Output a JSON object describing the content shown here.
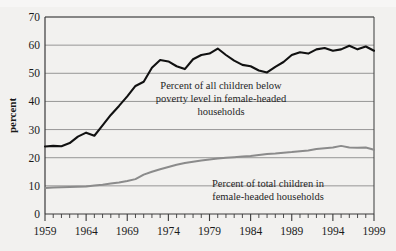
{
  "chart_data": {
    "type": "line",
    "title": "",
    "xlabel": "",
    "ylabel": "percent",
    "xlim": [
      1959,
      1999
    ],
    "ylim": [
      0,
      70
    ],
    "grid": true,
    "legend_position": "inline-annotations",
    "ytick_labels": [
      "0",
      "10",
      "20",
      "30",
      "40",
      "50",
      "60",
      "70"
    ],
    "ytick_values": [
      0,
      10,
      20,
      30,
      40,
      50,
      60,
      70
    ],
    "xtick_labels": [
      "1959",
      "1964",
      "1969",
      "1974",
      "1979",
      "1984",
      "1989",
      "1994",
      "1999"
    ],
    "xtick_values": [
      1959,
      1964,
      1969,
      1974,
      1979,
      1984,
      1989,
      1994,
      1999
    ],
    "x": [
      1959,
      1960,
      1961,
      1962,
      1963,
      1964,
      1965,
      1966,
      1967,
      1968,
      1969,
      1970,
      1971,
      1972,
      1973,
      1974,
      1975,
      1976,
      1977,
      1978,
      1979,
      1980,
      1981,
      1982,
      1983,
      1984,
      1985,
      1986,
      1987,
      1988,
      1989,
      1990,
      1991,
      1992,
      1993,
      1994,
      1995,
      1996,
      1997,
      1998,
      1999
    ],
    "series": [
      {
        "name": "Percent of all children below poverty level in female-headed households",
        "color": "#111111",
        "values": [
          24.0,
          24.2,
          24.1,
          25.2,
          27.5,
          28.9,
          27.8,
          31.5,
          35.2,
          38.4,
          41.8,
          45.5,
          47.0,
          52.0,
          54.7,
          54.2,
          52.5,
          51.5,
          55.0,
          56.5,
          57.0,
          58.8,
          56.5,
          54.5,
          53.0,
          52.5,
          51.0,
          50.3,
          52.3,
          54.0,
          56.5,
          57.5,
          57.0,
          58.5,
          59.0,
          58.0,
          58.5,
          59.8,
          58.5,
          59.5,
          58.0
        ]
      },
      {
        "name": "Percent of total children in female-headed households",
        "color": "#8b8b8b",
        "values": [
          9.2,
          9.4,
          9.5,
          9.6,
          9.7,
          9.8,
          10.1,
          10.4,
          10.8,
          11.2,
          11.7,
          12.4,
          14.0,
          15.0,
          15.9,
          16.7,
          17.5,
          18.1,
          18.6,
          19.0,
          19.4,
          19.7,
          20.0,
          20.2,
          20.4,
          20.6,
          21.0,
          21.3,
          21.5,
          21.8,
          22.0,
          22.3,
          22.6,
          23.1,
          23.4,
          23.6,
          24.2,
          23.6,
          23.5,
          23.6,
          22.8
        ]
      }
    ],
    "annotations": [
      {
        "name": "upper-series-label",
        "lines": [
          "Percent of all children below",
          "poverty level in female-headed",
          "households"
        ]
      },
      {
        "name": "lower-series-label",
        "lines": [
          "Percent of total children in",
          "female-headed households"
        ]
      }
    ]
  }
}
